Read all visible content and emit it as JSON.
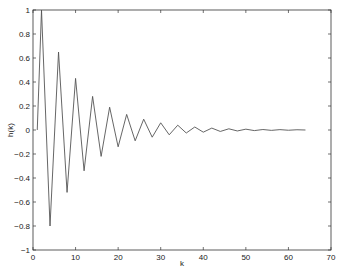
{
  "chart_data": {
    "type": "line",
    "title": "",
    "xlabel": "k",
    "ylabel": "h(k)",
    "xlim": [
      0,
      70
    ],
    "ylim": [
      -1,
      1
    ],
    "xticks": [
      0,
      10,
      20,
      30,
      40,
      50,
      60,
      70
    ],
    "xtick_labels": [
      "0",
      "10",
      "20",
      "30",
      "40",
      "50",
      "60",
      "70"
    ],
    "yticks": [
      -1,
      -0.8,
      -0.6,
      -0.4,
      -0.2,
      0,
      0.2,
      0.4,
      0.6,
      0.8,
      1
    ],
    "ytick_labels": [
      "−1",
      "−0.8",
      "−0.6",
      "−0.4",
      "−0.2",
      "0",
      "0.2",
      "0.4",
      "0.6",
      "0.8",
      "1"
    ],
    "grid": false,
    "legend": null,
    "line_color": "#555555",
    "series": [
      {
        "name": "h(k)",
        "x": [
          1,
          2,
          4,
          6,
          8,
          10,
          12,
          14,
          16,
          18,
          20,
          22,
          24,
          26,
          28,
          30,
          32,
          34,
          36,
          38,
          40,
          42,
          44,
          46,
          48,
          50,
          52,
          54,
          56,
          58,
          60,
          62,
          64
        ],
        "values": [
          0,
          1.0,
          -0.8,
          0.65,
          -0.52,
          0.43,
          -0.34,
          0.28,
          -0.22,
          0.19,
          -0.14,
          0.13,
          -0.09,
          0.09,
          -0.06,
          0.06,
          -0.04,
          0.04,
          -0.025,
          0.025,
          -0.018,
          0.016,
          -0.012,
          0.01,
          -0.008,
          0.007,
          -0.005,
          0.004,
          -0.003,
          0.003,
          -0.002,
          0.002,
          0.0
        ]
      }
    ]
  }
}
